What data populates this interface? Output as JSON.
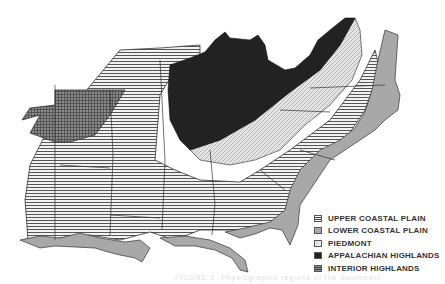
{
  "map": {
    "title": "Physiographic regions of the southeastern United States",
    "legend": [
      {
        "label": "UPPER COASTAL PLAIN",
        "pattern": "upper-coastal",
        "color": "#9a9a9a"
      },
      {
        "label": "LOWER COASTAL PLAIN",
        "pattern": "lower-coastal",
        "color": "#a8a8a8"
      },
      {
        "label": "PIEDMONT",
        "pattern": "piedmont",
        "color": "#d8d8d8"
      },
      {
        "label": "APPALACHIAN HIGHLANDS",
        "pattern": "appalachian",
        "color": "#222222"
      },
      {
        "label": "INTERIOR HIGHLANDS",
        "pattern": "interior",
        "color": "#6a6a6a"
      }
    ],
    "caption": "FIGURE 1. Physiographic regions of the Southeast"
  }
}
